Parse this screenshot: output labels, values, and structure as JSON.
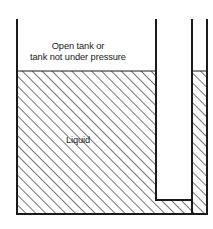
{
  "figure": {
    "type": "engineering-schematic",
    "width": 213,
    "height": 229,
    "background_color": "#ffffff",
    "line_color": "#1a1a1a",
    "hatch_color": "#555555",
    "liquid_fill_color": "#f2f2f2"
  },
  "labels": {
    "headnote_line1": "Open tank or",
    "headnote_line2": "tank not under pressure",
    "liquid": "Liquid"
  },
  "geometry": {
    "tank": {
      "left_wall_x": 17,
      "right_wall_x": 156,
      "top_y": 20,
      "bottom_y": 214
    },
    "liquid_surface_y": 71,
    "standpipe": {
      "inner_wall_x": 192,
      "outer_wall_x": 207,
      "top_y": 20,
      "bottom_y": 214
    },
    "channel": {
      "left_x": 156,
      "right_x": 192,
      "bottom_y": 200
    }
  }
}
